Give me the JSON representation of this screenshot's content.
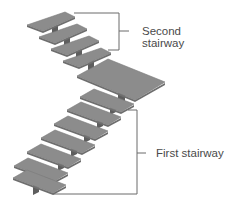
{
  "diagram": {
    "labels": {
      "second_line1": "Second",
      "second_line2": "stairway",
      "first": "First stairway"
    },
    "colors": {
      "tread": "#8c8c8c",
      "tread_edge": "#6e6e6e",
      "post": "#5e5e5e",
      "bracket": "#6a6a6a",
      "text": "#4a4a4a"
    },
    "components": [
      {
        "name": "Second stairway",
        "steps": 4
      },
      {
        "name": "Landing",
        "steps": 1
      },
      {
        "name": "First stairway",
        "steps": 7
      }
    ]
  }
}
